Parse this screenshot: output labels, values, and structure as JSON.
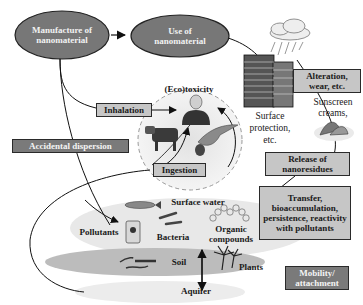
{
  "nodes": {
    "manufacture": "Manufacture of nanomaterial",
    "use": "Use of nanomaterial"
  },
  "boxes": {
    "inhalation": "Inhalation",
    "accidental_dispersion": "Accidental dispersion",
    "ingestion": "Ingestion",
    "alteration": "Alteration, wear, etc.",
    "release": "Release of nanoresidues",
    "transfer": "Transfer, bioaccumulation, persistence, reactivity with pollutants",
    "mobility": "Mobility/ attachment"
  },
  "labels": {
    "ecotoxicity": "(Eco)toxicity",
    "surface_protection": "Surface protection, etc.",
    "sunscreen": "Sunscreen creams,",
    "surface_water": "Surface water",
    "pollutants": "Pollutants",
    "bacteria": "Bacteria",
    "organic_compounds": "Organic compounds",
    "soil": "Soil",
    "plants": "Plants",
    "aquifer": "Aquifer"
  },
  "colors": {
    "node_fill": "#777777",
    "dark_box": "#7a7a7a",
    "light_box": "#c6c6c6",
    "zone_fill": "#e6e6e6",
    "soil_fill": "#bdbdbd"
  }
}
